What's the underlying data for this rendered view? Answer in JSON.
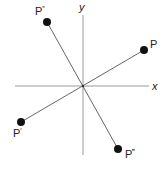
{
  "diagram": {
    "axes": {
      "x_label": "x",
      "y_label": "y",
      "color": "#9a9a9a"
    },
    "points": [
      {
        "name": "P",
        "label": "P",
        "sup": ""
      },
      {
        "name": "P-prime",
        "label": "P",
        "sup": "′"
      },
      {
        "name": "P-double-prime",
        "label": "P",
        "sup": "″"
      },
      {
        "name": "P-triple-prime",
        "label": "P",
        "sup": "‴"
      }
    ],
    "line_color": "#555555",
    "point_color": "#111111"
  }
}
